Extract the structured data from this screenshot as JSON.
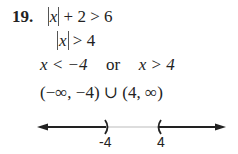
{
  "problem": {
    "number": "19.",
    "steps": [
      {
        "abs_var": "x",
        "rest": "+ 2 > 6"
      },
      {
        "abs_var": "x",
        "rest": "> 4"
      },
      {
        "left": "x < −4",
        "connector": "or",
        "right": "x > 4"
      },
      {
        "interval": "(−∞, −4) ∪ (4, ∞)"
      }
    ]
  },
  "number_line": {
    "labels": [
      "-4",
      "4"
    ],
    "left_endpoint": ")",
    "right_endpoint": "(",
    "line_color": "#222222",
    "gap_color": "#bbbbbb"
  }
}
